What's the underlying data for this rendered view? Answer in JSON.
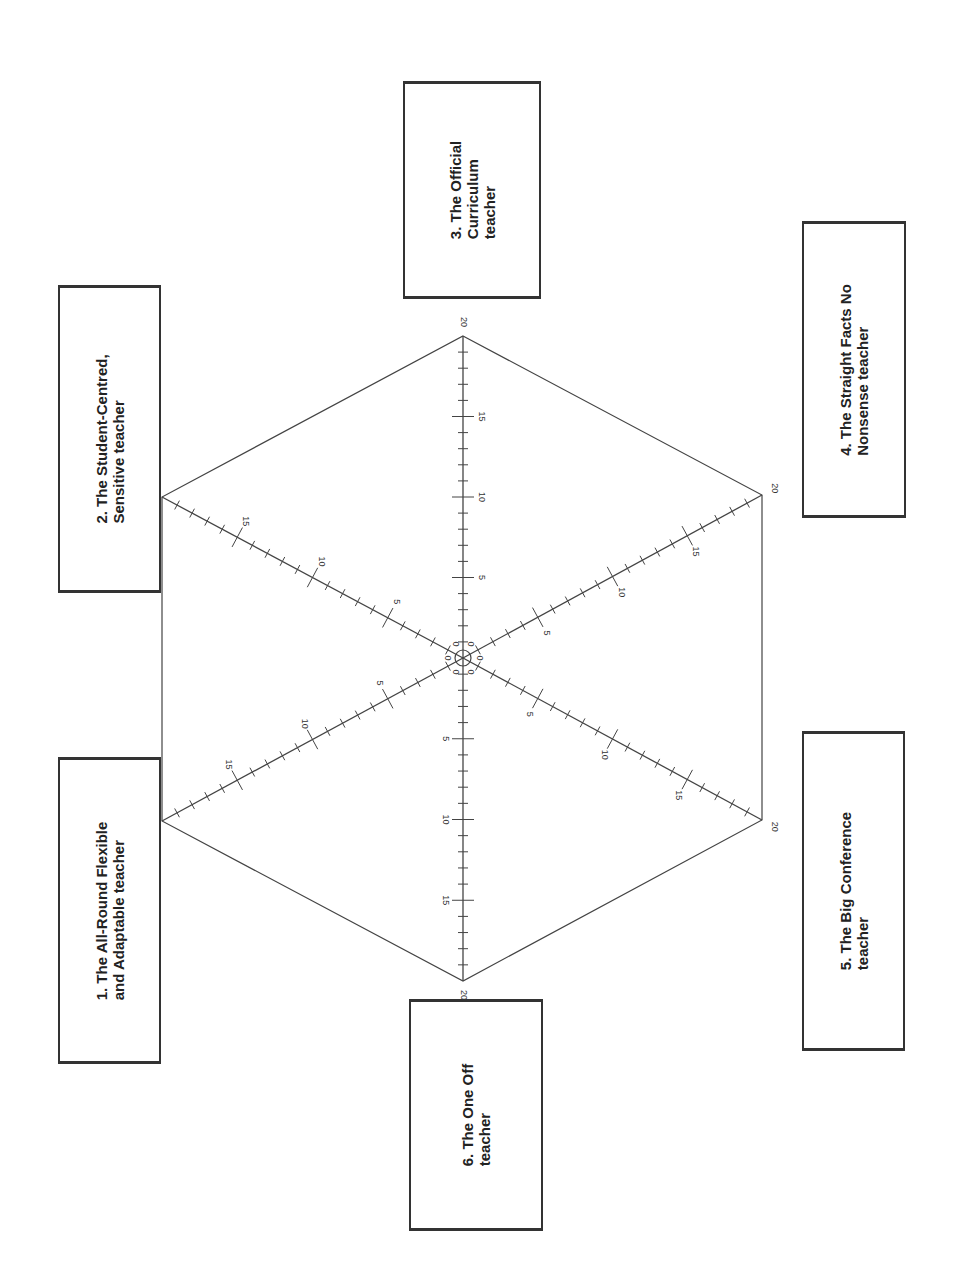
{
  "diagram": {
    "type": "hexagonal-radar-template",
    "orientation": "rotated-90-ccw",
    "center": [
      463,
      658
    ],
    "scale_max": 20,
    "axis_ticks": {
      "minor_step": 1,
      "major_every": 5,
      "labels": [
        "0",
        "5",
        "10",
        "15",
        "20"
      ]
    },
    "colors": {
      "line": "#444444",
      "box_border": "#333333",
      "text": "#222222",
      "background": "#ffffff"
    }
  },
  "axes": [
    {
      "id": 1,
      "vertex": [
        162,
        821
      ],
      "label": "1. The All-Round Flexible\nand Adaptable teacher"
    },
    {
      "id": 2,
      "vertex": [
        162,
        497
      ],
      "label": "2. The Student-Centred,\nSensitive teacher"
    },
    {
      "id": 3,
      "vertex": [
        463,
        336
      ],
      "label": "3. The Official\nCurriculum\nteacher"
    },
    {
      "id": 4,
      "vertex": [
        762,
        495
      ],
      "label": "4. The Straight Facts No\nNonsense teacher"
    },
    {
      "id": 5,
      "vertex": [
        762,
        820
      ],
      "label": "5. The Big Conference\nteacher"
    },
    {
      "id": 6,
      "vertex": [
        463,
        981
      ],
      "label": "6. The One Off\nteacher"
    }
  ],
  "label_boxes": [
    {
      "axis": 1,
      "x": 58,
      "y": 757,
      "w": 103,
      "h": 307
    },
    {
      "axis": 2,
      "x": 58,
      "y": 285,
      "w": 103,
      "h": 308
    },
    {
      "axis": 3,
      "x": 403,
      "y": 81,
      "w": 138,
      "h": 218
    },
    {
      "axis": 4,
      "x": 802,
      "y": 221,
      "w": 104,
      "h": 297
    },
    {
      "axis": 5,
      "x": 802,
      "y": 731,
      "w": 103,
      "h": 320
    },
    {
      "axis": 6,
      "x": 409,
      "y": 999,
      "w": 134,
      "h": 232
    }
  ],
  "labels": {
    "box_1": "1. The All-Round Flexible\nand Adaptable teacher",
    "box_2": "2. The Student-Centred,\nSensitive teacher",
    "box_3": "3. The Official\nCurriculum\nteacher",
    "box_4": "4. The Straight Facts No\nNonsense teacher",
    "box_5": "5. The Big Conference\nteacher",
    "box_6": "6. The One Off\nteacher"
  }
}
